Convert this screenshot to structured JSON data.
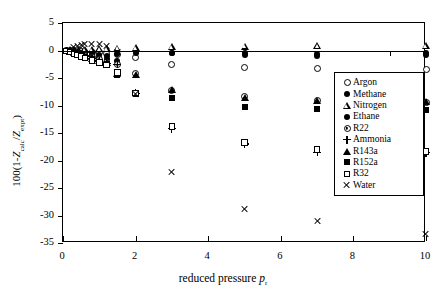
{
  "chart_data": {
    "type": "scatter",
    "title": "",
    "xlabel": "reduced pressure p r",
    "ylabel": "100(1-Z calc/Z expt)",
    "xlim": [
      0,
      10
    ],
    "ylim": [
      -35,
      5
    ],
    "xticks": [
      "0",
      "2",
      "4",
      "6",
      "8",
      "10"
    ],
    "xtick_values": [
      0,
      2,
      4,
      6,
      8,
      10
    ],
    "xtick_minor_values": [
      1,
      3,
      5,
      7,
      9
    ],
    "yticks": [
      "5",
      "0",
      "-5",
      "-10",
      "-15",
      "-20",
      "-25",
      "-30",
      "-35"
    ],
    "ytick_values": [
      5,
      0,
      -5,
      -10,
      -15,
      -20,
      -25,
      -30,
      -35
    ],
    "grid": false,
    "legend_position": "center-right",
    "series": [
      {
        "name": "Argon",
        "marker": "open-circle",
        "points": [
          [
            0.1,
            0.0
          ],
          [
            0.2,
            0.0
          ],
          [
            0.3,
            -0.05
          ],
          [
            0.4,
            -0.1
          ],
          [
            0.5,
            -0.15
          ],
          [
            0.6,
            -0.2
          ],
          [
            0.8,
            -0.3
          ],
          [
            1.0,
            -0.45
          ],
          [
            1.2,
            -0.6
          ],
          [
            1.5,
            -0.8
          ],
          [
            2.0,
            -1.2
          ],
          [
            3.0,
            -2.5
          ],
          [
            5.0,
            -3.1
          ],
          [
            7.0,
            -3.3
          ],
          [
            10.0,
            -3.5
          ]
        ]
      },
      {
        "name": "Methane",
        "marker": "filled-circle",
        "points": [
          [
            0.1,
            0.0
          ],
          [
            0.2,
            -0.05
          ],
          [
            0.3,
            -0.1
          ],
          [
            0.4,
            -0.2
          ],
          [
            0.5,
            -0.3
          ],
          [
            0.6,
            -0.4
          ],
          [
            0.8,
            -0.6
          ],
          [
            1.0,
            -0.8
          ],
          [
            1.2,
            -1.0
          ],
          [
            1.5,
            -0.6
          ],
          [
            2.0,
            -0.35
          ],
          [
            3.0,
            -0.4
          ],
          [
            5.0,
            -0.5
          ],
          [
            7.0,
            -0.6
          ],
          [
            10.0,
            -0.5
          ]
        ]
      },
      {
        "name": "Nitrogen",
        "marker": "open-triangle",
        "points": [
          [
            0.1,
            0.05
          ],
          [
            0.2,
            0.1
          ],
          [
            0.3,
            0.1
          ],
          [
            0.4,
            0.15
          ],
          [
            0.5,
            0.2
          ],
          [
            0.6,
            0.2
          ],
          [
            0.8,
            0.25
          ],
          [
            1.0,
            0.3
          ],
          [
            1.2,
            0.35
          ],
          [
            1.5,
            0.45
          ],
          [
            2.0,
            0.5
          ],
          [
            3.0,
            0.7
          ],
          [
            5.0,
            0.8
          ],
          [
            7.0,
            0.85
          ],
          [
            10.0,
            0.9
          ]
        ]
      },
      {
        "name": "Ethane",
        "marker": "filled-circle",
        "points": [
          [
            0.1,
            -0.05
          ],
          [
            0.2,
            -0.1
          ],
          [
            0.3,
            -0.2
          ],
          [
            0.4,
            -0.35
          ],
          [
            0.5,
            -0.5
          ],
          [
            0.6,
            -0.7
          ],
          [
            0.8,
            -1.0
          ],
          [
            1.0,
            -1.3
          ],
          [
            1.2,
            -1.6
          ],
          [
            1.5,
            -1.9
          ],
          [
            2.0,
            -0.4
          ],
          [
            3.0,
            -0.45
          ],
          [
            5.0,
            -0.9
          ],
          [
            7.0,
            -1.0
          ],
          [
            10.0,
            -0.8
          ]
        ]
      },
      {
        "name": "R22",
        "marker": "dot-circle",
        "points": [
          [
            0.1,
            -0.05
          ],
          [
            0.2,
            -0.15
          ],
          [
            0.3,
            -0.3
          ],
          [
            0.4,
            -0.5
          ],
          [
            0.5,
            -0.7
          ],
          [
            0.6,
            -0.9
          ],
          [
            0.8,
            -1.3
          ],
          [
            1.0,
            -1.7
          ],
          [
            1.2,
            -2.1
          ],
          [
            1.5,
            -2.6
          ],
          [
            2.0,
            -4.2
          ],
          [
            3.0,
            -7.2
          ],
          [
            5.0,
            -8.4
          ],
          [
            7.0,
            -9.0
          ],
          [
            10.0,
            -9.5
          ]
        ]
      },
      {
        "name": "Ammonia",
        "marker": "plus",
        "points": [
          [
            0.1,
            -0.05
          ],
          [
            0.2,
            -0.15
          ],
          [
            0.3,
            -0.3
          ],
          [
            0.4,
            -0.5
          ],
          [
            0.5,
            -0.8
          ],
          [
            0.6,
            -1.0
          ],
          [
            0.8,
            -1.5
          ],
          [
            1.0,
            -1.9
          ],
          [
            1.2,
            -2.3
          ],
          [
            1.5,
            -2.5
          ],
          [
            2.0,
            -7.8
          ],
          [
            3.0,
            -14.2
          ],
          [
            5.0,
            -17.0
          ],
          [
            7.0,
            -18.5
          ],
          [
            10.0,
            -18.6
          ]
        ]
      },
      {
        "name": "R143a",
        "marker": "filled-triangle",
        "points": [
          [
            0.1,
            -0.05
          ],
          [
            0.2,
            -0.15
          ],
          [
            0.3,
            -0.3
          ],
          [
            0.4,
            -0.5
          ],
          [
            0.5,
            -0.75
          ],
          [
            0.6,
            -1.0
          ],
          [
            0.8,
            -1.4
          ],
          [
            1.0,
            -1.8
          ],
          [
            1.2,
            -2.2
          ],
          [
            1.5,
            -4.1
          ],
          [
            2.0,
            -4.3
          ],
          [
            3.0,
            -7.1
          ],
          [
            5.0,
            -8.5
          ],
          [
            7.0,
            -9.1
          ],
          [
            10.0,
            -9.3
          ]
        ]
      },
      {
        "name": "R152a",
        "marker": "filled-square",
        "points": [
          [
            0.1,
            -0.1
          ],
          [
            0.2,
            -0.2
          ],
          [
            0.3,
            -0.4
          ],
          [
            0.4,
            -0.6
          ],
          [
            0.5,
            -0.9
          ],
          [
            0.6,
            -1.1
          ],
          [
            0.8,
            -1.6
          ],
          [
            1.0,
            -2.0
          ],
          [
            1.2,
            -2.4
          ],
          [
            1.5,
            -4.4
          ],
          [
            2.0,
            -7.9
          ],
          [
            3.0,
            -8.6
          ],
          [
            5.0,
            -10.2
          ],
          [
            7.0,
            -10.6
          ],
          [
            10.0,
            -10.9
          ]
        ]
      },
      {
        "name": "R32",
        "marker": "open-square",
        "points": [
          [
            0.1,
            -0.1
          ],
          [
            0.2,
            -0.25
          ],
          [
            0.3,
            -0.5
          ],
          [
            0.4,
            -0.8
          ],
          [
            0.5,
            -1.1
          ],
          [
            0.6,
            -1.4
          ],
          [
            0.8,
            -1.8
          ],
          [
            1.0,
            -2.2
          ],
          [
            1.2,
            -2.6
          ],
          [
            1.5,
            -4.0
          ],
          [
            2.0,
            -7.7
          ],
          [
            3.0,
            -13.8
          ],
          [
            5.0,
            -16.7
          ],
          [
            7.0,
            -18.0
          ],
          [
            10.0,
            -18.4
          ]
        ]
      },
      {
        "name": "Water",
        "marker": "cross",
        "points": [
          [
            0.3,
            0.6
          ],
          [
            0.4,
            0.8
          ],
          [
            0.5,
            1.0
          ],
          [
            0.6,
            1.1
          ],
          [
            0.8,
            1.2
          ],
          [
            1.0,
            1.2
          ],
          [
            1.2,
            0.9
          ],
          [
            1.5,
            -0.3
          ],
          [
            2.0,
            -7.9
          ],
          [
            3.0,
            -22.0
          ],
          [
            5.0,
            -28.8
          ],
          [
            7.0,
            -31.0
          ],
          [
            10.0,
            -33.3
          ]
        ]
      }
    ]
  },
  "legend": {
    "items": [
      {
        "label": "Argon",
        "marker": "open-circle"
      },
      {
        "label": "Methane",
        "marker": "filled-circle"
      },
      {
        "label": "Nitrogen",
        "marker": "open-triangle"
      },
      {
        "label": "Ethane",
        "marker": "filled-circle"
      },
      {
        "label": "R22",
        "marker": "dot-circle"
      },
      {
        "label": "Ammonia",
        "marker": "plus"
      },
      {
        "label": "R143a",
        "marker": "filled-triangle"
      },
      {
        "label": "R152a",
        "marker": "filled-square"
      },
      {
        "label": "R32",
        "marker": "open-square"
      },
      {
        "label": "Water",
        "marker": "cross"
      }
    ]
  },
  "axis_titles": {
    "x_main": "reduced pressure",
    "x_var": "p",
    "x_sub": "r",
    "y_prefix": "100(1-",
    "y_var1": "Z",
    "y_sub1": "calc",
    "y_mid": "/",
    "y_var2": "Z",
    "y_sub2": "expt",
    "y_suffix": ")"
  }
}
